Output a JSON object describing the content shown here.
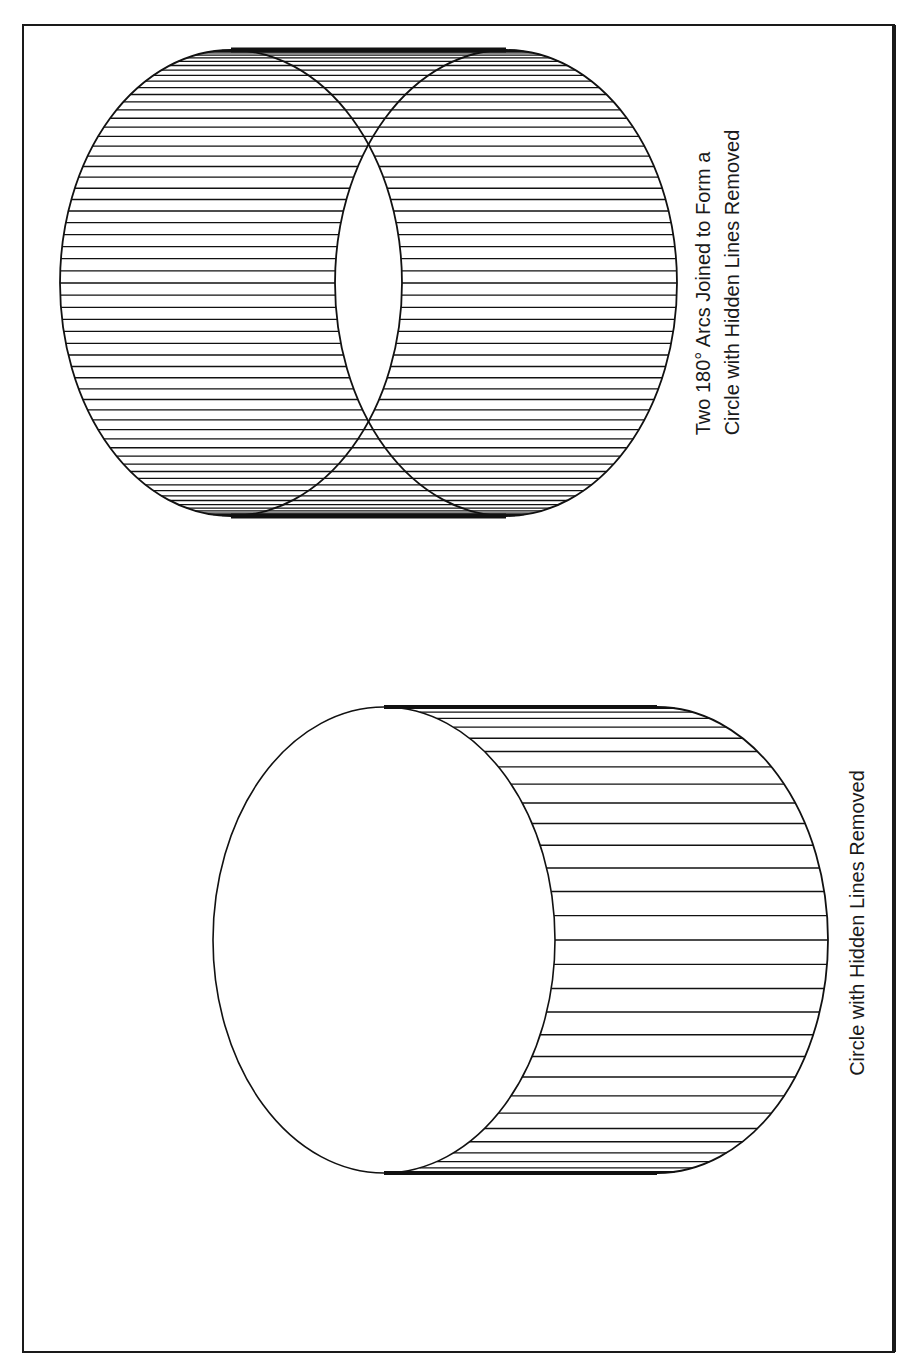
{
  "figure": {
    "frame": {
      "x": 23,
      "y": 25,
      "width": 871,
      "height": 1327,
      "stroke": "#1a1a1a"
    },
    "ring": {
      "title_lines": [
        "Two 180° Arcs Joined to Form a",
        "Circle with Hidden Lines Removed"
      ],
      "front_ellipse": {
        "cx": 231,
        "cy": 283,
        "rx": 171,
        "ry": 233
      },
      "back_ellipse": {
        "cx": 506,
        "cy": 283,
        "rx": 171,
        "ry": 233
      },
      "hatch_count": 61,
      "label_center": {
        "x": 718,
        "y": 282
      }
    },
    "drum": {
      "title": "Circle with Hidden Lines Removed",
      "face_ellipse": {
        "cx": 384,
        "cy": 940,
        "rx": 171,
        "ry": 233
      },
      "back_ellipse": {
        "cx": 657,
        "cy": 940,
        "rx": 171,
        "ry": 233
      },
      "hatch_count": 31,
      "label_center": {
        "x": 857,
        "y": 923
      }
    },
    "line_color": "#111111"
  }
}
